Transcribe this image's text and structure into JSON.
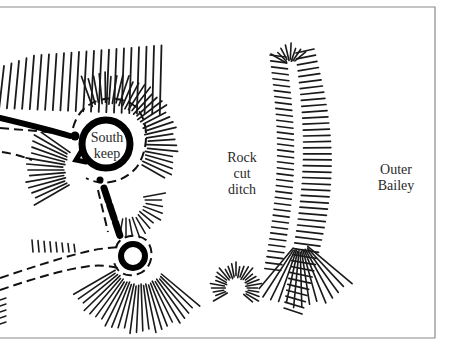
{
  "figure": {
    "type": "archaeological site plan (hachured earthworks)",
    "labels": {
      "south_keep": [
        "South",
        "keep"
      ],
      "rock_cut_ditch": [
        "Rock",
        "cut",
        "ditch"
      ],
      "outer_bailey": [
        "Outer",
        "Bailey"
      ]
    }
  }
}
